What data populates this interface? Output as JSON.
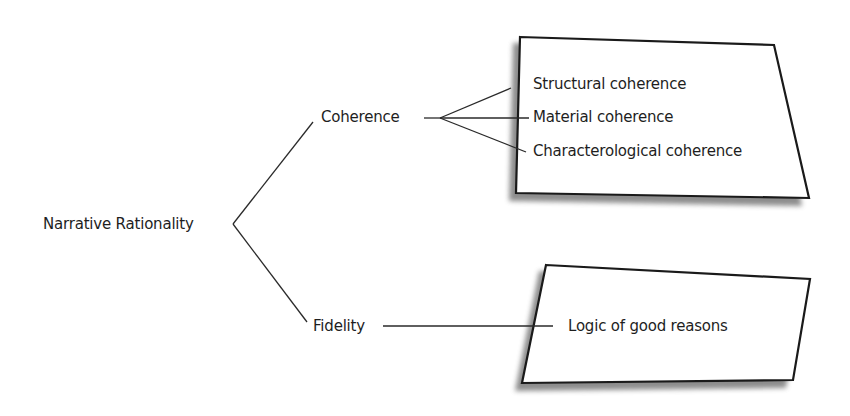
{
  "diagram": {
    "root": {
      "label": "Narrative Rationality"
    },
    "branches": [
      {
        "label": "Coherence",
        "children": [
          {
            "label": "Structural coherence"
          },
          {
            "label": "Material coherence"
          },
          {
            "label": "Characterological coherence"
          }
        ]
      },
      {
        "label": "Fidelity",
        "children": [
          {
            "label": "Logic of good reasons"
          }
        ]
      }
    ],
    "colors": {
      "line": "#2a2a2a",
      "box_fill": "#ffffff",
      "box_border": "#1a1a1a",
      "shadow": "#555555",
      "text": "#1e1e1e"
    }
  }
}
